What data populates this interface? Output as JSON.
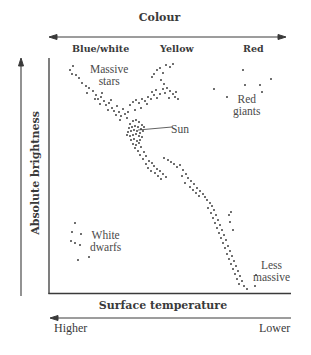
{
  "diagram": {
    "colour_axis": {
      "title": "Colour",
      "labels": [
        "Blue/white",
        "Yellow",
        "Red"
      ]
    },
    "y_axis": {
      "label": "Absolute brightness"
    },
    "x_axis": {
      "label": "Surface temperature",
      "higher": "Higher",
      "lower": "Lower"
    },
    "regions": {
      "massive": [
        "Massive",
        "stars"
      ],
      "sun": "Sun",
      "red_giants": [
        "Red",
        "giants"
      ],
      "white_dwarfs": [
        "White",
        "dwarfs"
      ],
      "less_massive": [
        "Less",
        "massive"
      ]
    },
    "colors": {
      "ink": "#3a3a3a",
      "dot": "#333333",
      "background": "#ffffff"
    }
  },
  "chart_data": {
    "type": "scatter",
    "xlabel": "Surface temperature (Higher → Lower)",
    "ylabel": "Absolute brightness",
    "top_axis": "Colour: Blue/white, Yellow, Red",
    "grid": false,
    "annotations": [
      "Massive stars",
      "Sun",
      "Red giants",
      "White dwarfs",
      "Less massive"
    ],
    "series": [
      {
        "name": "Main sequence (upper, massive stars)",
        "points": [
          [
            70,
            70
          ],
          [
            73,
            66
          ],
          [
            72,
            74
          ],
          [
            76,
            75
          ],
          [
            79,
            78
          ],
          [
            82,
            83
          ],
          [
            86,
            86
          ],
          [
            89,
            88
          ],
          [
            93,
            91
          ],
          [
            96,
            95
          ],
          [
            98,
            99
          ],
          [
            101,
            97
          ],
          [
            104,
            101
          ],
          [
            100,
            104
          ],
          [
            106,
            105
          ],
          [
            109,
            103
          ],
          [
            112,
            108
          ],
          [
            108,
            110
          ],
          [
            114,
            111
          ],
          [
            117,
            106
          ],
          [
            119,
            112
          ],
          [
            116,
            115
          ],
          [
            121,
            116
          ],
          [
            123,
            109
          ],
          [
            125,
            114
          ],
          [
            127,
            118
          ],
          [
            120,
            120
          ],
          [
            111,
            100
          ],
          [
            102,
            93
          ],
          [
            95,
            99
          ],
          [
            87,
            93
          ]
        ]
      },
      {
        "name": "Main sequence (branch to yellow)",
        "points": [
          [
            130,
            105
          ],
          [
            133,
            102
          ],
          [
            136,
            100
          ],
          [
            139,
            103
          ],
          [
            142,
            99
          ],
          [
            145,
            101
          ],
          [
            148,
            97
          ],
          [
            151,
            99
          ],
          [
            154,
            95
          ],
          [
            157,
            98
          ],
          [
            147,
            104
          ],
          [
            141,
            108
          ],
          [
            135,
            110
          ],
          [
            128,
            112
          ],
          [
            152,
            92
          ],
          [
            156,
            90
          ],
          [
            160,
            94
          ],
          [
            163,
            89
          ]
        ]
      },
      {
        "name": "Sun cluster",
        "points": [
          [
            130,
            124
          ],
          [
            133,
            121
          ],
          [
            136,
            120
          ],
          [
            139,
            122
          ],
          [
            142,
            125
          ],
          [
            129,
            128
          ],
          [
            132,
            127
          ],
          [
            135,
            126
          ],
          [
            138,
            127
          ],
          [
            141,
            129
          ],
          [
            128,
            132
          ],
          [
            131,
            131
          ],
          [
            134,
            130
          ],
          [
            137,
            131
          ],
          [
            140,
            133
          ],
          [
            143,
            131
          ],
          [
            130,
            136
          ],
          [
            133,
            135
          ],
          [
            136,
            134
          ],
          [
            139,
            136
          ],
          [
            142,
            137
          ],
          [
            131,
            140
          ],
          [
            134,
            139
          ],
          [
            137,
            141
          ],
          [
            140,
            140
          ],
          [
            133,
            144
          ],
          [
            136,
            145
          ],
          [
            139,
            143
          ],
          [
            127,
            135
          ],
          [
            144,
            127
          ]
        ]
      },
      {
        "name": "Main sequence (middle)",
        "points": [
          [
            135,
            148
          ],
          [
            138,
            151
          ],
          [
            141,
            147
          ],
          [
            144,
            152
          ],
          [
            140,
            155
          ],
          [
            146,
            156
          ],
          [
            143,
            159
          ],
          [
            149,
            161
          ],
          [
            146,
            164
          ],
          [
            152,
            163
          ],
          [
            148,
            168
          ],
          [
            154,
            166
          ],
          [
            151,
            171
          ],
          [
            157,
            169
          ],
          [
            155,
            173
          ],
          [
            160,
            171
          ],
          [
            158,
            176
          ],
          [
            163,
            174
          ],
          [
            161,
            179
          ],
          [
            166,
            177
          ],
          [
            164,
            158
          ],
          [
            168,
            160
          ],
          [
            171,
            162
          ],
          [
            174,
            164
          ],
          [
            177,
            167
          ],
          [
            180,
            165
          ],
          [
            183,
            170
          ],
          [
            186,
            174
          ],
          [
            182,
            176
          ],
          [
            188,
            178
          ],
          [
            191,
            181
          ],
          [
            185,
            183
          ],
          [
            194,
            184
          ],
          [
            190,
            187
          ],
          [
            197,
            188
          ],
          [
            193,
            190
          ],
          [
            200,
            191
          ],
          [
            196,
            193
          ],
          [
            203,
            194
          ],
          [
            199,
            196
          ],
          [
            205,
            197
          ]
        ]
      },
      {
        "name": "Main sequence (lower, less massive)",
        "points": [
          [
            207,
            200
          ],
          [
            210,
            203
          ],
          [
            212,
            206
          ],
          [
            208,
            208
          ],
          [
            214,
            210
          ],
          [
            211,
            213
          ],
          [
            216,
            215
          ],
          [
            213,
            218
          ],
          [
            218,
            220
          ],
          [
            215,
            223
          ],
          [
            220,
            225
          ],
          [
            217,
            228
          ],
          [
            222,
            230
          ],
          [
            219,
            233
          ],
          [
            224,
            235
          ],
          [
            221,
            238
          ],
          [
            226,
            240
          ],
          [
            223,
            243
          ],
          [
            228,
            246
          ],
          [
            225,
            248
          ],
          [
            230,
            251
          ],
          [
            227,
            254
          ],
          [
            232,
            256
          ],
          [
            229,
            259
          ],
          [
            234,
            261
          ],
          [
            231,
            264
          ],
          [
            236,
            266
          ],
          [
            233,
            269
          ],
          [
            238,
            271
          ],
          [
            235,
            274
          ],
          [
            240,
            276
          ],
          [
            237,
            279
          ],
          [
            242,
            281
          ],
          [
            239,
            284
          ],
          [
            244,
            286
          ],
          [
            247,
            289
          ],
          [
            255,
            286
          ],
          [
            256,
            275
          ],
          [
            233,
            230
          ],
          [
            230,
            222
          ],
          [
            229,
            215
          ],
          [
            231,
            212
          ]
        ]
      },
      {
        "name": "Yellow branch (subgiants)",
        "points": [
          [
            154,
            74
          ],
          [
            157,
            70
          ],
          [
            160,
            68
          ],
          [
            163,
            73
          ],
          [
            166,
            65
          ],
          [
            170,
            67
          ],
          [
            173,
            64
          ],
          [
            152,
            77
          ],
          [
            161,
            80
          ],
          [
            164,
            84
          ],
          [
            167,
            88
          ],
          [
            170,
            91
          ],
          [
            173,
            94
          ],
          [
            175,
            97
          ],
          [
            169,
            98
          ],
          [
            178,
            99
          ],
          [
            165,
            93
          ],
          [
            176,
            92
          ]
        ]
      },
      {
        "name": "Red giants",
        "points": [
          [
            214,
            89
          ],
          [
            243,
            70
          ],
          [
            245,
            85
          ],
          [
            260,
            85
          ],
          [
            271,
            79
          ],
          [
            227,
            97
          ],
          [
            262,
            92
          ]
        ]
      },
      {
        "name": "White dwarfs",
        "points": [
          [
            75,
            223
          ],
          [
            72,
            232
          ],
          [
            81,
            234
          ],
          [
            71,
            241
          ],
          [
            75,
            243
          ],
          [
            80,
            245
          ],
          [
            78,
            260
          ],
          [
            89,
            257
          ]
        ]
      }
    ],
    "xlim": [
      "Higher",
      "Lower"
    ],
    "ylim": [
      "Low",
      "High"
    ]
  }
}
